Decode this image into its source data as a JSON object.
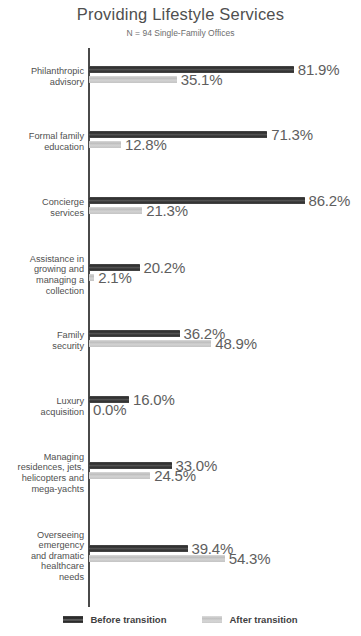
{
  "chart_data": {
    "type": "bar",
    "title": "Providing Lifestyle Services",
    "subtitle": "N = 94 Single-Family Offices",
    "orientation": "horizontal",
    "xlabel": "",
    "ylabel": "",
    "xlim": [
      0,
      100
    ],
    "grid": false,
    "legend_position": "bottom",
    "value_suffix": "%",
    "categories": [
      "Philanthropic advisory",
      "Formal family education",
      "Concierge services",
      "Assistance in growing and managing a collection",
      "Family security",
      "Luxury acquisition",
      "Managing residences, jets, helicopters and mega-yachts",
      "Overseeing emergency and dramatic healthcare needs"
    ],
    "category_lines": [
      [
        "Philanthropic",
        "advisory"
      ],
      [
        "Formal family",
        "education"
      ],
      [
        "Concierge",
        "services"
      ],
      [
        "Assistance in",
        "growing and",
        "managing a",
        "collection"
      ],
      [
        "Family",
        "security"
      ],
      [
        "Luxury",
        "acquisition"
      ],
      [
        "Managing",
        "residences, jets,",
        "helicopters and",
        "mega-yachts"
      ],
      [
        "Overseeing",
        "emergency",
        "and dramatic",
        "healthcare",
        "needs"
      ]
    ],
    "series": [
      {
        "name": "Before transition",
        "color": "#3a3a3a",
        "values": [
          81.9,
          71.3,
          86.2,
          20.2,
          36.2,
          16.0,
          33.0,
          39.4
        ],
        "labels": [
          "81.9%",
          "71.3%",
          "86.2%",
          "20.2%",
          "36.2%",
          "16.0%",
          "33.0%",
          "39.4%"
        ]
      },
      {
        "name": "After transition",
        "color": "#c9c9c9",
        "values": [
          35.1,
          12.8,
          21.3,
          2.1,
          48.9,
          0.0,
          24.5,
          54.3
        ],
        "labels": [
          "35.1%",
          "12.8%",
          "21.3%",
          "2.1%",
          "48.9%",
          "0.0%",
          "24.5%",
          "54.3%"
        ]
      }
    ]
  },
  "legend": {
    "items": [
      {
        "label": "Before transition",
        "color": "#3a3a3a"
      },
      {
        "label": "After transition",
        "color": "#c9c9c9"
      }
    ]
  }
}
